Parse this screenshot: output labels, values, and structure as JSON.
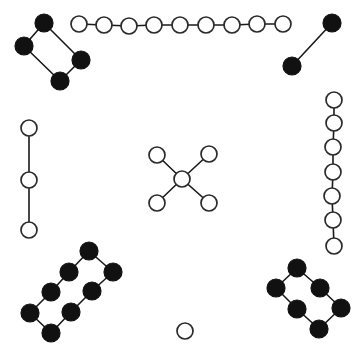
{
  "figure": {
    "width": 364,
    "height": 358,
    "background_color": "#ffffff",
    "node_styles": {
      "filled": {
        "fill": "#111111",
        "stroke": "#111111",
        "radius": 9
      },
      "open": {
        "fill": "#ffffff",
        "stroke": "#2b2b2b",
        "radius": 8
      }
    },
    "edge_style": {
      "stroke": "#1a1a1a",
      "stroke_width": 1.6
    },
    "summary": {
      "component_count": 8,
      "node_count": 44,
      "filled_node_count": 20,
      "open_node_count": 24
    }
  },
  "components": [
    {
      "id": "top-left-diamond",
      "label": "top-left filled 4-cycle",
      "style": "filled",
      "node_count": 4,
      "edge_count": 4,
      "nodes": [
        {
          "id": "tl1",
          "x": 44,
          "y": 23
        },
        {
          "id": "tl2",
          "x": 24,
          "y": 46
        },
        {
          "id": "tl3",
          "x": 81,
          "y": 60
        },
        {
          "id": "tl4",
          "x": 60,
          "y": 81
        }
      ],
      "edges": [
        [
          "tl1",
          "tl2"
        ],
        [
          "tl1",
          "tl3"
        ],
        [
          "tl2",
          "tl4"
        ],
        [
          "tl3",
          "tl4"
        ]
      ]
    },
    {
      "id": "top-open-path",
      "label": "top horizontal open path",
      "style": "open",
      "node_count": 9,
      "edge_count": 8,
      "nodes": [
        {
          "id": "tp1",
          "x": 79,
          "y": 24
        },
        {
          "id": "tp2",
          "x": 104,
          "y": 25
        },
        {
          "id": "tp3",
          "x": 129,
          "y": 26
        },
        {
          "id": "tp4",
          "x": 154,
          "y": 25
        },
        {
          "id": "tp5",
          "x": 180,
          "y": 25
        },
        {
          "id": "tp6",
          "x": 206,
          "y": 25
        },
        {
          "id": "tp7",
          "x": 232,
          "y": 25
        },
        {
          "id": "tp8",
          "x": 257,
          "y": 24
        },
        {
          "id": "tp9",
          "x": 283,
          "y": 24
        }
      ],
      "edges": [
        [
          "tp1",
          "tp2"
        ],
        [
          "tp2",
          "tp3"
        ],
        [
          "tp3",
          "tp4"
        ],
        [
          "tp4",
          "tp5"
        ],
        [
          "tp5",
          "tp6"
        ],
        [
          "tp6",
          "tp7"
        ],
        [
          "tp7",
          "tp8"
        ],
        [
          "tp8",
          "tp9"
        ]
      ]
    },
    {
      "id": "top-right-edge",
      "label": "top-right filled single edge",
      "style": "filled",
      "node_count": 2,
      "edge_count": 1,
      "nodes": [
        {
          "id": "tr1",
          "x": 332,
          "y": 23
        },
        {
          "id": "tr2",
          "x": 292,
          "y": 66
        }
      ],
      "edges": [
        [
          "tr1",
          "tr2"
        ]
      ]
    },
    {
      "id": "left-open-path",
      "label": "left vertical open path",
      "style": "open",
      "node_count": 3,
      "edge_count": 2,
      "nodes": [
        {
          "id": "lp1",
          "x": 29,
          "y": 128
        },
        {
          "id": "lp2",
          "x": 29,
          "y": 180
        },
        {
          "id": "lp3",
          "x": 29,
          "y": 230
        }
      ],
      "edges": [
        [
          "lp1",
          "lp2"
        ],
        [
          "lp2",
          "lp3"
        ]
      ]
    },
    {
      "id": "center-star",
      "label": "center open star (claw) graph",
      "style": "open",
      "node_count": 5,
      "edge_count": 4,
      "nodes": [
        {
          "id": "cs-center",
          "x": 182,
          "y": 179
        },
        {
          "id": "cs-ul",
          "x": 157,
          "y": 155
        },
        {
          "id": "cs-ur",
          "x": 209,
          "y": 154
        },
        {
          "id": "cs-ll",
          "x": 157,
          "y": 203
        },
        {
          "id": "cs-lr",
          "x": 209,
          "y": 203
        }
      ],
      "edges": [
        [
          "cs-center",
          "cs-ul"
        ],
        [
          "cs-center",
          "cs-ur"
        ],
        [
          "cs-center",
          "cs-ll"
        ],
        [
          "cs-center",
          "cs-lr"
        ]
      ]
    },
    {
      "id": "right-open-path",
      "label": "right vertical open path",
      "style": "open",
      "node_count": 7,
      "edge_count": 6,
      "nodes": [
        {
          "id": "rp1",
          "x": 334,
          "y": 100
        },
        {
          "id": "rp2",
          "x": 334,
          "y": 123
        },
        {
          "id": "rp3",
          "x": 333,
          "y": 147
        },
        {
          "id": "rp4",
          "x": 333,
          "y": 172
        },
        {
          "id": "rp5",
          "x": 332,
          "y": 196
        },
        {
          "id": "rp6",
          "x": 333,
          "y": 220
        },
        {
          "id": "rp7",
          "x": 334,
          "y": 246
        }
      ],
      "edges": [
        [
          "rp1",
          "rp2"
        ],
        [
          "rp2",
          "rp3"
        ],
        [
          "rp3",
          "rp4"
        ],
        [
          "rp4",
          "rp5"
        ],
        [
          "rp5",
          "rp6"
        ],
        [
          "rp6",
          "rp7"
        ]
      ]
    },
    {
      "id": "bottom-left-ladder",
      "label": "bottom-left filled 8-node cycle",
      "style": "filled",
      "node_count": 8,
      "edge_count": 8,
      "nodes": [
        {
          "id": "bl1",
          "x": 89,
          "y": 251
        },
        {
          "id": "bl2",
          "x": 69,
          "y": 272
        },
        {
          "id": "bl3",
          "x": 113,
          "y": 272
        },
        {
          "id": "bl4",
          "x": 51,
          "y": 292
        },
        {
          "id": "bl5",
          "x": 92,
          "y": 291
        },
        {
          "id": "bl6",
          "x": 30,
          "y": 313
        },
        {
          "id": "bl7",
          "x": 71,
          "y": 312
        },
        {
          "id": "bl8",
          "x": 51,
          "y": 333
        }
      ],
      "edges": [
        [
          "bl1",
          "bl2"
        ],
        [
          "bl1",
          "bl3"
        ],
        [
          "bl2",
          "bl4"
        ],
        [
          "bl3",
          "bl5"
        ],
        [
          "bl4",
          "bl6"
        ],
        [
          "bl5",
          "bl7"
        ],
        [
          "bl6",
          "bl8"
        ],
        [
          "bl7",
          "bl8"
        ]
      ]
    },
    {
      "id": "bottom-right-ladder",
      "label": "bottom-right filled 6-node cycle",
      "style": "filled",
      "node_count": 6,
      "edge_count": 6,
      "nodes": [
        {
          "id": "br1",
          "x": 297,
          "y": 268
        },
        {
          "id": "br2",
          "x": 276,
          "y": 288
        },
        {
          "id": "br3",
          "x": 320,
          "y": 288
        },
        {
          "id": "br4",
          "x": 297,
          "y": 309
        },
        {
          "id": "br5",
          "x": 341,
          "y": 308
        },
        {
          "id": "br6",
          "x": 319,
          "y": 329
        }
      ],
      "edges": [
        [
          "br1",
          "br2"
        ],
        [
          "br1",
          "br3"
        ],
        [
          "br2",
          "br4"
        ],
        [
          "br3",
          "br5"
        ],
        [
          "br4",
          "br6"
        ],
        [
          "br5",
          "br6"
        ]
      ]
    },
    {
      "id": "isolated-node",
      "label": "isolated open node",
      "style": "open",
      "node_count": 1,
      "edge_count": 0,
      "nodes": [
        {
          "id": "iso1",
          "x": 185,
          "y": 331
        }
      ],
      "edges": []
    }
  ]
}
